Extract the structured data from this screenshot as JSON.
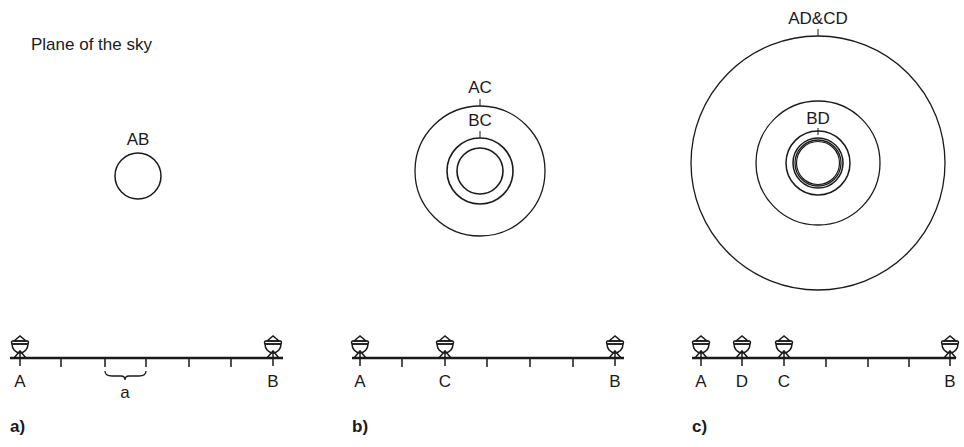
{
  "title": "Plane of the sky",
  "panels": [
    {
      "label": "a)",
      "circles_label": "AB",
      "stations": [
        "A",
        "B"
      ],
      "spacing_label": "a"
    },
    {
      "label": "b)",
      "circle_labels": [
        "AC",
        "BC"
      ],
      "stations": [
        "A",
        "C",
        "B"
      ]
    },
    {
      "label": "c)",
      "circle_labels": [
        "AD&CD",
        "BD"
      ],
      "stations": [
        "A",
        "D",
        "C",
        "B"
      ]
    }
  ],
  "colors": {
    "ink": "#1a1a1a",
    "background": "#ffffff"
  }
}
